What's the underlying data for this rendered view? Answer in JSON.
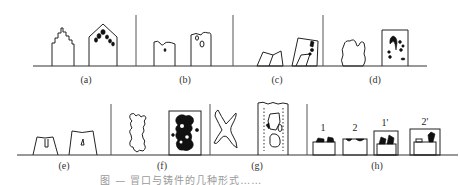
{
  "figure": {
    "caption": "图 — 冒口与铸件的几种形式……",
    "rows": [
      {
        "panels": [
          {
            "id": "a",
            "label": "(a)",
            "description": "stepped-top casting outline (left) and gabled casting with shrinkage voids near apex (right)"
          },
          {
            "id": "b",
            "label": "(b)",
            "description": "casting with notched top (left) and casting with dented top containing small voids (right)"
          },
          {
            "id": "c",
            "label": "(c)",
            "description": "tilted trapezoid (left) and tilted shape inside box with voids at upper right (right)"
          },
          {
            "id": "d",
            "label": "(d)",
            "description": "lumpy casting outline (left) and box with scattered dark shrinkage spots (right)"
          }
        ]
      },
      {
        "panels": [
          {
            "id": "e",
            "label": "(e)",
            "description": "two trapezoid castings with small internal cavities"
          },
          {
            "id": "f",
            "label": "(f)",
            "description": "irregular dendritic casting outline (left) and box filled with dark porosity (right)"
          },
          {
            "id": "g",
            "label": "(g)",
            "description": "X-shaped casting (left) and tall casting with dotted boundary and oval cavities (right)"
          },
          {
            "id": "h",
            "label": "(h)",
            "description": "four small castings with risers",
            "sub_labels": [
              "1",
              "2",
              "1'",
              "2'"
            ]
          }
        ]
      }
    ]
  }
}
